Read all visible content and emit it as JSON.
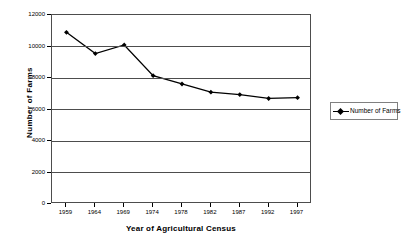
{
  "chart_data": {
    "type": "line",
    "title": "",
    "xlabel": "Year of Agricultural Census",
    "ylabel": "Number of Farms",
    "categories": [
      "1959",
      "1964",
      "1969",
      "1974",
      "1978",
      "1982",
      "1987",
      "1992",
      "1997"
    ],
    "series": [
      {
        "name": "Number of Farms",
        "values": [
          10900,
          9550,
          10100,
          8150,
          7620,
          7100,
          6950,
          6700,
          6750
        ],
        "color": "#000000",
        "marker": "diamond"
      }
    ],
    "ylim": [
      0,
      12000
    ],
    "yticks": [
      0,
      2000,
      4000,
      6000,
      8000,
      10000,
      12000
    ],
    "ytick_labels": [
      "0",
      "2000",
      "4000",
      "6000",
      "8000",
      "10000",
      "12000"
    ],
    "grid": true,
    "grid_axis": "y",
    "grid_color": "#4d4d4d",
    "legend_position": "right",
    "legend_entries": [
      "Number of Farms"
    ],
    "plot_border_color": "#4d4d4d",
    "background_color": "#ffffff"
  }
}
